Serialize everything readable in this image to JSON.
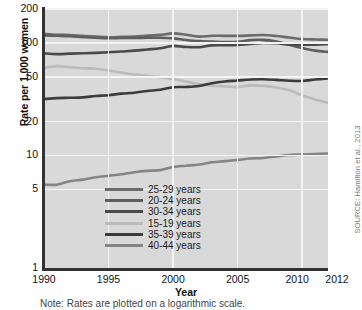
{
  "chart_data": {
    "type": "line",
    "title": "",
    "xlabel": "Year",
    "ylabel": "Rate per 1,000 women",
    "note": "Note: Rates are plotted on a logarithmic scale.",
    "source": "SOURCE: Hamilton et al., 2013",
    "yscale": "log",
    "ylim": [
      1,
      200
    ],
    "xlim": [
      1990,
      2012
    ],
    "grid": true,
    "legend_position": "bottom-center",
    "yticks": [
      200,
      100,
      50,
      20,
      10,
      5,
      1
    ],
    "ytick_labels": [
      "200",
      "100",
      "50",
      "20",
      "10",
      "5",
      "1"
    ],
    "xticks": [
      1990,
      1995,
      2000,
      2005,
      2010,
      2012
    ],
    "xtick_labels": [
      "1990",
      "1995",
      "2000",
      "2005",
      "2010",
      "2012"
    ],
    "x": [
      1990,
      1991,
      1992,
      1993,
      1994,
      1995,
      1996,
      1997,
      1998,
      1999,
      2000,
      2001,
      2002,
      2003,
      2004,
      2005,
      2006,
      2007,
      2008,
      2009,
      2010,
      2011,
      2012
    ],
    "series": [
      {
        "name": "25-29 years",
        "color": "#6b6b6b",
        "values": [
          120.2,
          118.2,
          117.4,
          115.5,
          113.9,
          112.2,
          113.1,
          113.8,
          115.9,
          117.8,
          121.4,
          118.0,
          113.6,
          115.6,
          115.5,
          115.5,
          116.5,
          117.5,
          115.1,
          111.5,
          108.3,
          107.2,
          106.5
        ]
      },
      {
        "name": "20-24 years",
        "color": "#5f5f5f",
        "values": [
          116.5,
          115.7,
          114.6,
          112.6,
          111.1,
          109.8,
          110.4,
          110.4,
          111.2,
          111.0,
          109.7,
          106.2,
          103.6,
          102.6,
          101.7,
          102.2,
          105.9,
          106.3,
          103.0,
          96.3,
          90.0,
          85.3,
          83.1
        ]
      },
      {
        "name": "30-34 years",
        "color": "#4a4a4a",
        "values": [
          80.8,
          79.5,
          80.2,
          80.8,
          81.5,
          82.5,
          83.9,
          85.3,
          87.4,
          89.6,
          94.1,
          91.9,
          91.5,
          95.1,
          95.3,
          95.8,
          97.7,
          99.9,
          99.3,
          96.5,
          96.5,
          96.5,
          97.3
        ]
      },
      {
        "name": "15-19 years",
        "color": "#bbbbbb",
        "values": [
          59.9,
          62.1,
          60.7,
          59.6,
          58.9,
          56.8,
          54.4,
          52.3,
          51.1,
          49.6,
          47.7,
          45.3,
          43.0,
          41.6,
          41.1,
          40.5,
          41.9,
          41.5,
          40.2,
          37.9,
          34.2,
          31.3,
          29.4
        ]
      },
      {
        "name": "35-39 years",
        "color": "#3c3c3c",
        "values": [
          31.7,
          32.3,
          32.5,
          32.8,
          33.7,
          34.3,
          35.4,
          36.1,
          37.4,
          38.3,
          40.4,
          40.6,
          41.4,
          43.8,
          45.4,
          46.3,
          47.3,
          47.5,
          46.9,
          46.1,
          45.9,
          47.2,
          48.3
        ]
      },
      {
        "name": "40-44 years",
        "color": "#858585",
        "values": [
          5.5,
          5.5,
          5.9,
          6.1,
          6.4,
          6.6,
          6.8,
          7.1,
          7.3,
          7.4,
          7.9,
          8.1,
          8.3,
          8.7,
          8.9,
          9.1,
          9.4,
          9.5,
          9.8,
          10.1,
          10.2,
          10.3,
          10.4
        ]
      }
    ]
  },
  "legend": {
    "items": [
      {
        "label": "25-29 years",
        "color": "#6b6b6b"
      },
      {
        "label": "20-24 years",
        "color": "#5f5f5f"
      },
      {
        "label": "30-34 years",
        "color": "#4a4a4a"
      },
      {
        "label": "15-19 years",
        "color": "#bbbbbb"
      },
      {
        "label": "35-39 years",
        "color": "#3c3c3c"
      },
      {
        "label": "40-44 years",
        "color": "#858585"
      }
    ]
  }
}
